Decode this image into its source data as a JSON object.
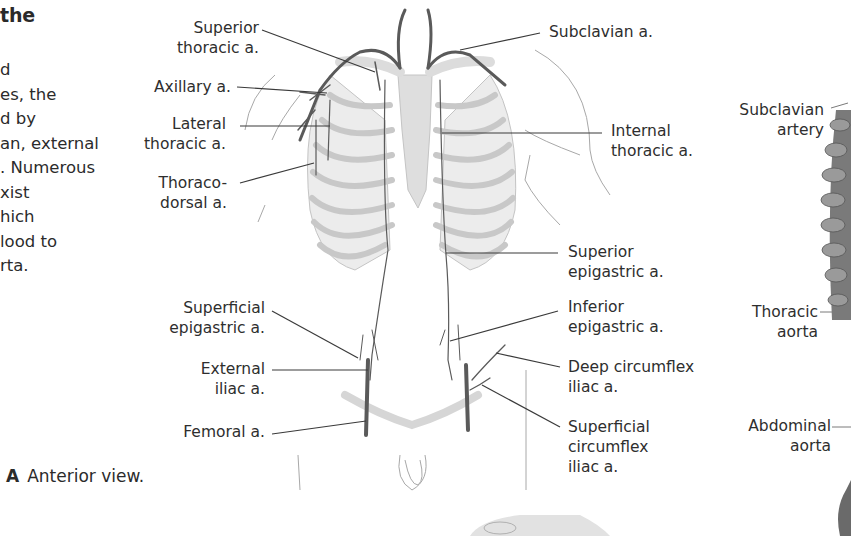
{
  "text_column": {
    "heading_fragment": "the",
    "lines": [
      "d",
      "es, the",
      "d by",
      "an, external",
      ". Numerous",
      "xist",
      "hich",
      "lood to",
      "rta."
    ]
  },
  "figure_a": {
    "caption_letter": "A",
    "caption_text": "Anterior view.",
    "labels_left": [
      {
        "line1": "Superior",
        "line2": "thoracic a."
      },
      {
        "line1": "Axillary a.",
        "line2": ""
      },
      {
        "line1": "Lateral",
        "line2": "thoracic a."
      },
      {
        "line1": "Thoraco-",
        "line2": "dorsal a."
      },
      {
        "line1": "Superficial",
        "line2": "epigastric a."
      },
      {
        "line1": "External",
        "line2": "iliac a."
      },
      {
        "line1": "Femoral a.",
        "line2": ""
      }
    ],
    "labels_right": [
      {
        "line1": "Subclavian a.",
        "line2": ""
      },
      {
        "line1": "Internal",
        "line2": "thoracic a."
      },
      {
        "line1": "Superior",
        "line2": "epigastric a."
      },
      {
        "line1": "Inferior",
        "line2": "epigastric a."
      },
      {
        "line1": "Deep circumflex",
        "line2": "iliac a."
      },
      {
        "line1": "Superficial",
        "line2": "circumflex",
        "line3": "iliac a."
      }
    ]
  },
  "figure_b": {
    "labels": [
      {
        "line1": "Subclavian",
        "line2": "artery"
      },
      {
        "line1": "Thoracic",
        "line2": "aorta"
      },
      {
        "line1": "Abdominal",
        "line2": "aorta"
      }
    ]
  },
  "colors": {
    "text": "#2b2b2b",
    "leader_line": "#3a3a3a",
    "artery": "#5a5a5a",
    "bone": "#e6e6e6",
    "bone_outline": "#bdbdbd"
  }
}
